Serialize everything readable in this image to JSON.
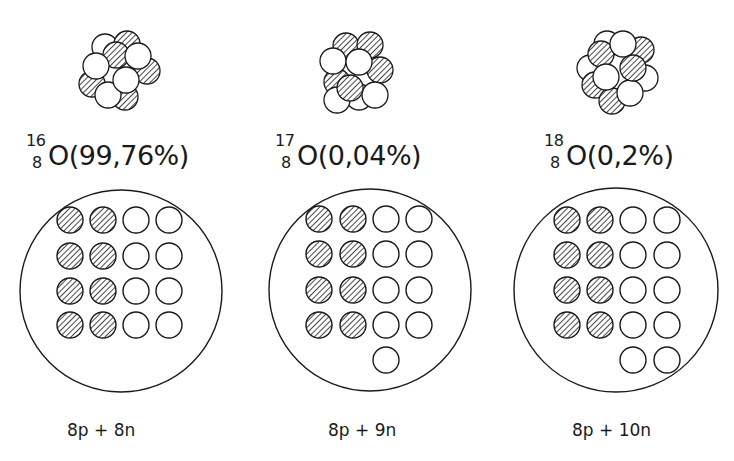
{
  "figure": {
    "colors": {
      "ink": "#1a1a1a",
      "background": "#ffffff"
    },
    "panels": [
      {
        "mass_number": "16",
        "atomic_number": "8",
        "symbol": "O",
        "abundance": "(99,76%)",
        "composition": "8p + 8n",
        "protons": 8,
        "neutrons": 8
      },
      {
        "mass_number": "17",
        "atomic_number": "8",
        "symbol": "O",
        "abundance": "(0,04%)",
        "composition": "8p + 9n",
        "protons": 8,
        "neutrons": 9
      },
      {
        "mass_number": "18",
        "atomic_number": "8",
        "symbol": "O",
        "abundance": "(0,2%)",
        "composition": "8p + 10n",
        "protons": 8,
        "neutrons": 10
      }
    ],
    "legend": {
      "hatched_circle": "proton",
      "open_circle": "neutron"
    }
  }
}
